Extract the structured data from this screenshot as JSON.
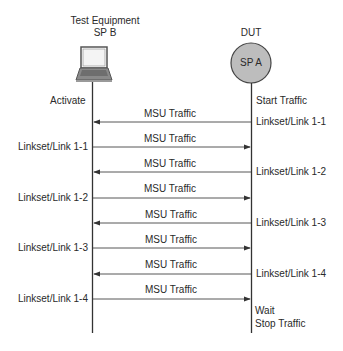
{
  "participants": {
    "left": {
      "title_line1": "Test Equipment",
      "title_line2": "SP B",
      "icon": "laptop-icon"
    },
    "right": {
      "title": "DUT",
      "node_label": "SP A",
      "node_color": "#bdbdbd",
      "icon": "node-circle-icon"
    }
  },
  "annotations": {
    "left_start": "Activate",
    "right_start": "Start Traffic",
    "right_end_1": "Wait",
    "right_end_2": "Stop Traffic"
  },
  "messages": [
    {
      "label": "MSU Traffic",
      "direction": "right-to-left",
      "left_note": "",
      "right_note": "Linkset/Link 1-1"
    },
    {
      "label": "MSU Traffic",
      "direction": "left-to-right",
      "left_note": "Linkset/Link 1-1",
      "right_note": ""
    },
    {
      "label": "MSU Traffic",
      "direction": "right-to-left",
      "left_note": "",
      "right_note": "Linkset/Link 1-2"
    },
    {
      "label": "MSU Traffic",
      "direction": "left-to-right",
      "left_note": "Linkset/Link 1-2",
      "right_note": ""
    },
    {
      "label": "MSU Traffic",
      "direction": "right-to-left",
      "left_note": "",
      "right_note": "Linkset/Link 1-3"
    },
    {
      "label": "MSU Traffic",
      "direction": "left-to-right",
      "left_note": "Linkset/Link 1-3",
      "right_note": ""
    },
    {
      "label": "MSU Traffic",
      "direction": "right-to-left",
      "left_note": "",
      "right_note": "Linkset/Link 1-4"
    },
    {
      "label": "MSU Traffic",
      "direction": "left-to-right",
      "left_note": "Linkset/Link 1-4",
      "right_note": ""
    }
  ],
  "colors": {
    "line": "#333333",
    "node_fill": "#bdbdbd"
  }
}
